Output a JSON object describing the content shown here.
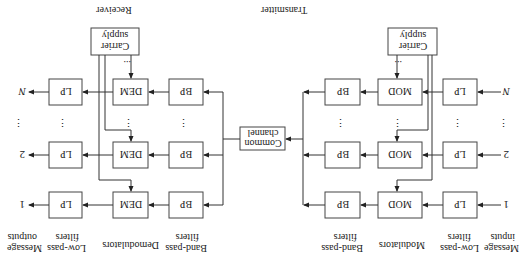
{
  "transmitter": {
    "title": "Transmitter",
    "col_labels": {
      "inputs": [
        "Message",
        "inputs"
      ],
      "lowpass": [
        "Low-pass",
        "filters"
      ],
      "modulators": [
        "Modulators"
      ],
      "bandpass": [
        "Band-pass",
        "filters"
      ]
    },
    "rows": [
      {
        "input": "1",
        "lp": "LP",
        "mod": "MOD",
        "bp": "BP"
      },
      {
        "input": "2",
        "lp": "LP",
        "mod": "MOD",
        "bp": "BP"
      },
      {
        "input": "N",
        "lp": "LP",
        "mod": "MOD",
        "bp": "BP"
      }
    ],
    "carrier": [
      "Carrier",
      "supply"
    ],
    "ellipsis": "⋮",
    "h_ellipsis": "..."
  },
  "channel": {
    "label": [
      "Common",
      "channel"
    ]
  },
  "receiver": {
    "title": "Receiver",
    "col_labels": {
      "bandpass": [
        "Band-pass",
        "filters"
      ],
      "demodulators": [
        "Demodulators"
      ],
      "lowpass": [
        "Low-pass",
        "filters"
      ],
      "outputs": [
        "Message",
        "outputs"
      ]
    },
    "rows": [
      {
        "bp": "BP",
        "dem": "DEM",
        "lp": "LP",
        "output": "1"
      },
      {
        "bp": "BP",
        "dem": "DEM",
        "lp": "LP",
        "output": "2"
      },
      {
        "bp": "BP",
        "dem": "DEM",
        "lp": "LP",
        "output": "N"
      }
    ],
    "carrier": [
      "Carrier",
      "supply"
    ],
    "ellipsis": "⋮",
    "h_ellipsis": "..."
  },
  "orientation_note": "rotated 180 degrees"
}
